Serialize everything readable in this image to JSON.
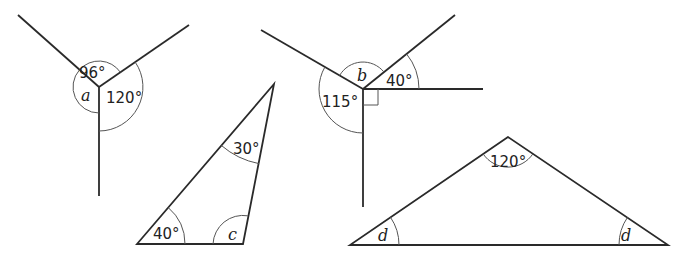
{
  "figures": [
    {
      "id": "angles-at-point-a",
      "type": "angles-around-a-point",
      "labels": {
        "top": "96°",
        "right": "120°",
        "unknown": "a"
      }
    },
    {
      "id": "triangle-c",
      "type": "triangle",
      "labels": {
        "top": "30°",
        "bottom_left": "40°",
        "unknown": "c"
      }
    },
    {
      "id": "angles-at-point-b",
      "type": "angles-around-a-point",
      "labels": {
        "left": "115°",
        "right": "40°",
        "unknown": "b"
      },
      "right_angle_marker": true
    },
    {
      "id": "triangle-d",
      "type": "isosceles-triangle",
      "labels": {
        "apex": "120°",
        "unknown_left": "d",
        "unknown_right": "d"
      }
    }
  ]
}
